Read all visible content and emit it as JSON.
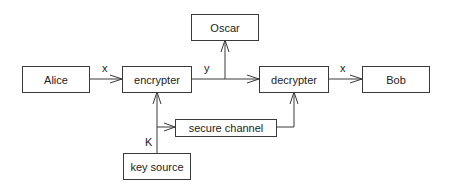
{
  "diagram": {
    "nodes": {
      "alice": "Alice",
      "encrypter": "encrypter",
      "oscar": "Oscar",
      "decrypter": "decrypter",
      "bob": "Bob",
      "secure_channel": "secure channel",
      "key_source": "key source"
    },
    "edge_labels": {
      "plaintext_in": "x",
      "ciphertext": "y",
      "plaintext_out": "x",
      "key": "K"
    },
    "edges": [
      {
        "from": "Alice",
        "to": "encrypter",
        "label": "x"
      },
      {
        "from": "encrypter",
        "to": "decrypter",
        "label": "y"
      },
      {
        "from": "encrypter",
        "to": "Oscar",
        "label": "y"
      },
      {
        "from": "decrypter",
        "to": "Bob",
        "label": "x"
      },
      {
        "from": "key source",
        "to": "encrypter",
        "label": "K"
      },
      {
        "from": "key source",
        "to": "secure channel",
        "label": "K"
      },
      {
        "from": "secure channel",
        "to": "decrypter",
        "label": ""
      }
    ],
    "colors": {
      "line": "#3a3a3a",
      "background": "#ffffff",
      "text": "#222222"
    }
  }
}
